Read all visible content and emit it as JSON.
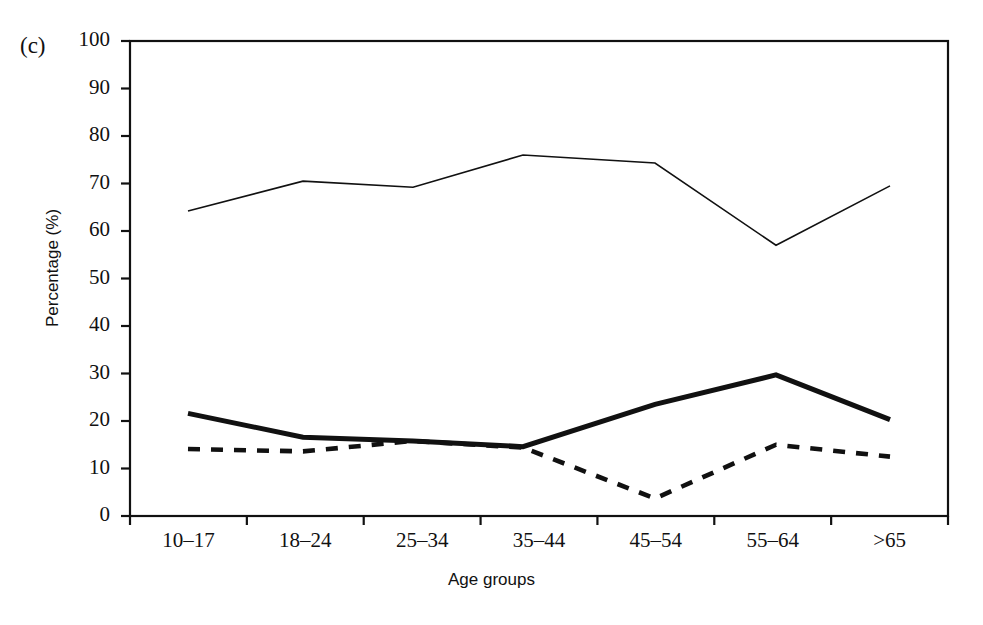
{
  "figure": {
    "panel_label": "(c)",
    "ylabel": "Percentage (%)",
    "xlabel": "Age groups"
  },
  "chart_data": {
    "type": "line",
    "title": "",
    "subtitle": "",
    "panel": "(c)",
    "xlabel": "Age groups",
    "ylabel": "Percentage (%)",
    "categories": [
      "10–17",
      "18–24",
      "25–34",
      "35–44",
      "45–54",
      "55–64",
      ">65"
    ],
    "ylim": [
      0,
      100
    ],
    "yticks": [
      0,
      10,
      20,
      30,
      40,
      50,
      60,
      70,
      80,
      90,
      100
    ],
    "ytick_labels": [
      "0",
      "10",
      "20",
      "30",
      "40",
      "50",
      "60",
      "70",
      "80",
      "90",
      "100"
    ],
    "grid": false,
    "legend": "none",
    "series": [
      {
        "name": "thin-solid-line",
        "style": "solid",
        "linewidth": 1.6,
        "color": "#111111",
        "values": [
          64.2,
          70.5,
          69.2,
          76.0,
          74.3,
          57.0,
          69.5
        ]
      },
      {
        "name": "thick-solid-line",
        "style": "solid",
        "linewidth": 5.0,
        "color": "#111111",
        "values": [
          21.6,
          16.6,
          15.8,
          14.6,
          23.5,
          29.7,
          20.3
        ]
      },
      {
        "name": "dashed-line",
        "style": "dashed",
        "linewidth": 4.6,
        "color": "#111111",
        "values": [
          14.1,
          13.6,
          15.8,
          14.4,
          3.7,
          15.0,
          12.5
        ]
      }
    ]
  },
  "axes": {
    "plot_left": 130,
    "plot_right": 948,
    "plot_top": 41,
    "plot_bottom": 516,
    "x_positions": [
      188,
      303,
      413,
      523,
      655,
      776,
      890
    ]
  }
}
